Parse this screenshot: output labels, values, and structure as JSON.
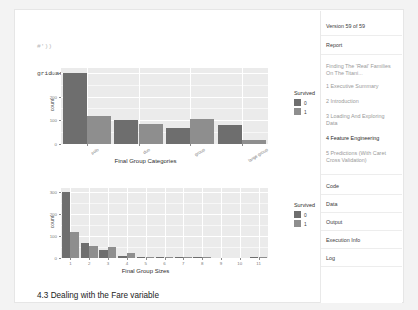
{
  "code": {
    "lines": [
      {
        "text": "#'))",
        "faint": true
      },
      {
        "text": "grid.arrange(g2, g1)",
        "faint": false
      }
    ]
  },
  "section_heading": "4.3 Dealing with the Fare variable",
  "sidebar": {
    "version_label": "Version 59 of 59",
    "report_label": "Report",
    "notebook_title": "Finding The 'Real' Families On The Titani...",
    "toc": [
      {
        "label": "1 Executive Summary",
        "selected": false
      },
      {
        "label": "2 Introduction",
        "selected": false
      },
      {
        "label": "3 Loading And Exploring Data",
        "selected": false
      },
      {
        "label": "4 Feature Engineering",
        "selected": true
      },
      {
        "label": "5 Predictions (With Caret Cross Validation)",
        "selected": false
      }
    ],
    "meta": [
      {
        "label": "Code"
      },
      {
        "label": "Data"
      },
      {
        "label": "Output"
      },
      {
        "label": "Execution Info"
      },
      {
        "label": "Log"
      }
    ]
  },
  "colors": {
    "panel": "#ebebeb",
    "bar_0": "#6e6e6e",
    "bar_1": "#8e8e8e",
    "grid_major": "#ffffff",
    "grid_minor": "#f6f6f6",
    "text": "#4a4a4a"
  },
  "chart_data": [
    {
      "id": "chart-group-categories",
      "type": "bar",
      "title": "",
      "xlabel": "Final Group Categories",
      "ylabel": "count",
      "legend_title": "Survived",
      "legend_position": "right",
      "grid": true,
      "ylim": [
        0,
        320
      ],
      "yticks": [
        0,
        100,
        200,
        300
      ],
      "ytick_labels": [
        "0",
        "100",
        "200",
        "300"
      ],
      "categories": [
        "solo",
        "duo",
        "group",
        "large group"
      ],
      "series": [
        {
          "name": "0",
          "color": "#6e6e6e",
          "values": [
            300,
            103,
            68,
            78
          ]
        },
        {
          "name": "1",
          "color": "#8e8e8e",
          "values": [
            117,
            85,
            107,
            19
          ]
        }
      ]
    },
    {
      "id": "chart-group-sizes",
      "type": "bar",
      "title": "",
      "xlabel": "Final Group Sizes",
      "ylabel": "count",
      "legend_title": "Survived",
      "legend_position": "right",
      "grid": true,
      "ylim": [
        0,
        320
      ],
      "yticks": [
        0,
        100,
        200,
        300
      ],
      "ytick_labels": [
        "0",
        "100",
        "200",
        "300"
      ],
      "categories": [
        "1",
        "2",
        "3",
        "4",
        "5",
        "6",
        "7",
        "8",
        "9",
        "10",
        "11"
      ],
      "series": [
        {
          "name": "0",
          "color": "#6e6e6e",
          "values": [
            300,
            70,
            38,
            10,
            5,
            3,
            4,
            5,
            0,
            0,
            4
          ]
        },
        {
          "name": "1",
          "color": "#8e8e8e",
          "values": [
            118,
            56,
            49,
            23,
            5,
            3,
            4,
            4,
            0,
            0,
            4
          ]
        }
      ]
    }
  ]
}
